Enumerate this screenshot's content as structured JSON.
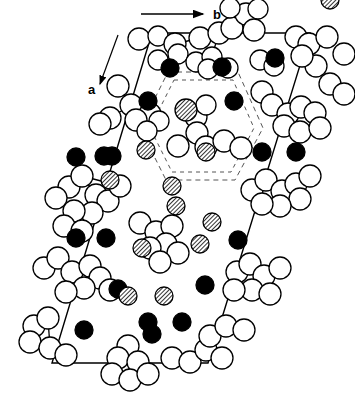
{
  "figure": {
    "kind": "crystal-structure-projection",
    "caption": "",
    "background_color": "#ffffff",
    "stroke_color": "#000000",
    "width": 355,
    "height": 397
  },
  "axes": {
    "b_axis": {
      "label": "b",
      "arrow_from": [
        141,
        14
      ],
      "arrow_to": [
        203,
        14
      ],
      "label_pos": [
        213,
        19
      ]
    },
    "a_axis": {
      "label": "a",
      "arrow_from": [
        118,
        35
      ],
      "arrow_to": [
        100,
        84
      ],
      "label_pos": [
        88,
        94
      ]
    }
  },
  "unit_cell": {
    "name": "unit-cell-parallelogram",
    "stroke": "#000000",
    "stroke_width": 1.4,
    "corners": [
      [
        152,
        33
      ],
      [
        310,
        33
      ],
      [
        208,
        363
      ],
      [
        52,
        363
      ]
    ]
  },
  "dashed_hexagons": [
    {
      "name": "outer-dashed-hexagon",
      "stroke": "#555555",
      "dash": "5,4",
      "points": [
        [
          168,
          72
        ],
        [
          238,
          72
        ],
        [
          263,
          128
        ],
        [
          235,
          180
        ],
        [
          166,
          180
        ],
        [
          140,
          128
        ]
      ]
    },
    {
      "name": "inner-dashed-hexagon",
      "stroke": "#555555",
      "dash": "4,4",
      "points": [
        [
          174,
          80
        ],
        [
          233,
          80
        ],
        [
          254,
          128
        ],
        [
          231,
          172
        ],
        [
          172,
          172
        ],
        [
          150,
          128
        ]
      ]
    }
  ],
  "atom_legend": [
    {
      "key": "open",
      "label": "open-circle-atom",
      "fill": "#ffffff",
      "stroke": "#000000"
    },
    {
      "key": "filled",
      "label": "filled-black-atom",
      "fill": "#000000",
      "stroke": "#000000"
    },
    {
      "key": "hatched",
      "label": "hatched-atom",
      "fill": "hatch-pattern",
      "stroke": "#000000"
    }
  ],
  "chart_data": {
    "type": "scatter",
    "title": "",
    "xlabel": "b",
    "ylabel": "a",
    "xlim": [
      0,
      355
    ],
    "ylim": [
      0,
      397
    ],
    "grid": false,
    "legend": [
      "open",
      "filled",
      "hatched"
    ],
    "series": [
      {
        "name": "open",
        "points": [
          [
            139,
            39,
            11
          ],
          [
            158,
            36,
            10
          ],
          [
            175,
            44,
            11
          ],
          [
            200,
            38,
            11
          ],
          [
            219,
            33,
            11
          ],
          [
            232,
            28,
            11
          ],
          [
            246,
            14,
            11
          ],
          [
            254,
            30,
            11
          ],
          [
            230,
            8,
            10
          ],
          [
            258,
            9,
            10
          ],
          [
            296,
            37,
            11
          ],
          [
            309,
            44,
            11
          ],
          [
            327,
            37,
            11
          ],
          [
            344,
            54,
            11
          ],
          [
            316,
            66,
            11
          ],
          [
            302,
            56,
            11
          ],
          [
            158,
            60,
            10
          ],
          [
            178,
            54,
            10
          ],
          [
            196,
            62,
            10
          ],
          [
            212,
            57,
            10
          ],
          [
            208,
            69,
            10
          ],
          [
            228,
            68,
            10
          ],
          [
            260,
            60,
            10
          ],
          [
            274,
            66,
            10
          ],
          [
            118,
            86,
            11
          ],
          [
            131,
            105,
            11
          ],
          [
            110,
            118,
            11
          ],
          [
            150,
            114,
            11
          ],
          [
            136,
            120,
            11
          ],
          [
            159,
            121,
            10
          ],
          [
            100,
            124,
            11
          ],
          [
            147,
            131,
            10
          ],
          [
            262,
            92,
            11
          ],
          [
            272,
            105,
            11
          ],
          [
            288,
            114,
            11
          ],
          [
            301,
            107,
            11
          ],
          [
            315,
            113,
            11
          ],
          [
            284,
            126,
            11
          ],
          [
            300,
            132,
            11
          ],
          [
            320,
            128,
            11
          ],
          [
            196,
            117,
            11
          ],
          [
            206,
            105,
            10
          ],
          [
            197,
            133,
            11
          ],
          [
            178,
            146,
            11
          ],
          [
            206,
            147,
            11
          ],
          [
            224,
            141,
            11
          ],
          [
            241,
            148,
            11
          ],
          [
            69,
            187,
            11
          ],
          [
            82,
            176,
            11
          ],
          [
            56,
            198,
            11
          ],
          [
            96,
            195,
            11
          ],
          [
            108,
            201,
            11
          ],
          [
            92,
            213,
            11
          ],
          [
            74,
            211,
            11
          ],
          [
            120,
            186,
            11
          ],
          [
            64,
            226,
            11
          ],
          [
            82,
            231,
            11
          ],
          [
            252,
            190,
            11
          ],
          [
            266,
            180,
            11
          ],
          [
            282,
            191,
            11
          ],
          [
            296,
            184,
            11
          ],
          [
            300,
            199,
            11
          ],
          [
            280,
            206,
            11
          ],
          [
            262,
            204,
            11
          ],
          [
            310,
            176,
            11
          ],
          [
            140,
            223,
            11
          ],
          [
            156,
            232,
            11
          ],
          [
            172,
            226,
            11
          ],
          [
            166,
            244,
            11
          ],
          [
            150,
            248,
            11
          ],
          [
            178,
            253,
            11
          ],
          [
            160,
            262,
            11
          ],
          [
            44,
            268,
            11
          ],
          [
            58,
            258,
            11
          ],
          [
            72,
            272,
            11
          ],
          [
            90,
            266,
            11
          ],
          [
            100,
            278,
            11
          ],
          [
            84,
            288,
            11
          ],
          [
            66,
            292,
            11
          ],
          [
            110,
            290,
            11
          ],
          [
            237,
            272,
            11
          ],
          [
            250,
            264,
            11
          ],
          [
            264,
            276,
            11
          ],
          [
            280,
            268,
            11
          ],
          [
            252,
            290,
            11
          ],
          [
            270,
            294,
            11
          ],
          [
            234,
            290,
            11
          ],
          [
            34,
            326,
            11
          ],
          [
            48,
            318,
            11
          ],
          [
            30,
            342,
            11
          ],
          [
            50,
            348,
            11
          ],
          [
            66,
            355,
            11
          ],
          [
            128,
            346,
            11
          ],
          [
            118,
            358,
            11
          ],
          [
            138,
            362,
            11
          ],
          [
            112,
            374,
            11
          ],
          [
            130,
            380,
            11
          ],
          [
            148,
            374,
            11
          ],
          [
            172,
            358,
            11
          ],
          [
            190,
            362,
            11
          ],
          [
            206,
            350,
            11
          ],
          [
            222,
            358,
            11
          ],
          [
            210,
            336,
            11
          ],
          [
            226,
            326,
            11
          ],
          [
            244,
            330,
            11
          ],
          [
            330,
            84,
            11
          ],
          [
            344,
            94,
            11
          ]
        ]
      },
      {
        "name": "filled",
        "points": [
          [
            170,
            68,
            9
          ],
          [
            222,
            67,
            9
          ],
          [
            275,
            58,
            9
          ],
          [
            148,
            101,
            9
          ],
          [
            234,
            101,
            9
          ],
          [
            262,
            152,
            9
          ],
          [
            112,
            156,
            9
          ],
          [
            104,
            156,
            9
          ],
          [
            76,
            238,
            9
          ],
          [
            106,
            238,
            9
          ],
          [
            238,
            240,
            9
          ],
          [
            118,
            289,
            9
          ],
          [
            205,
            285,
            9
          ],
          [
            84,
            330,
            9
          ],
          [
            148,
            322,
            9
          ],
          [
            182,
            322,
            9
          ],
          [
            152,
            334,
            9
          ],
          [
            296,
            152,
            9
          ],
          [
            76,
            157,
            9
          ]
        ]
      },
      {
        "name": "hatched",
        "points": [
          [
            186,
            110,
            11
          ],
          [
            146,
            150,
            9
          ],
          [
            206,
            152,
            9
          ],
          [
            176,
            206,
            9
          ],
          [
            172,
            186,
            9
          ],
          [
            212,
            222,
            9
          ],
          [
            142,
            248,
            9
          ],
          [
            200,
            244,
            9
          ],
          [
            128,
            296,
            9
          ],
          [
            164,
            296,
            9
          ],
          [
            330,
            0,
            9
          ],
          [
            110,
            180,
            9
          ]
        ]
      }
    ],
    "bonds": [
      [
        139,
        39,
        158,
        36
      ],
      [
        158,
        36,
        175,
        44
      ],
      [
        175,
        44,
        200,
        38
      ],
      [
        200,
        38,
        219,
        33
      ],
      [
        219,
        33,
        232,
        28
      ],
      [
        232,
        28,
        246,
        14
      ],
      [
        219,
        33,
        208,
        69
      ],
      [
        232,
        28,
        254,
        30
      ],
      [
        296,
        37,
        309,
        44
      ],
      [
        309,
        44,
        327,
        37
      ],
      [
        309,
        44,
        316,
        66
      ],
      [
        316,
        66,
        302,
        56
      ],
      [
        118,
        86,
        131,
        105
      ],
      [
        131,
        105,
        110,
        118
      ],
      [
        131,
        105,
        150,
        114
      ],
      [
        131,
        105,
        136,
        120
      ],
      [
        136,
        120,
        147,
        131
      ],
      [
        110,
        118,
        100,
        124
      ],
      [
        262,
        92,
        272,
        105
      ],
      [
        272,
        105,
        288,
        114
      ],
      [
        288,
        114,
        301,
        107
      ],
      [
        288,
        114,
        284,
        126
      ],
      [
        284,
        126,
        300,
        132
      ],
      [
        300,
        132,
        320,
        128
      ],
      [
        196,
        117,
        206,
        105
      ],
      [
        196,
        117,
        197,
        133
      ],
      [
        197,
        133,
        178,
        146
      ],
      [
        197,
        133,
        206,
        147
      ],
      [
        206,
        147,
        224,
        141
      ],
      [
        224,
        141,
        241,
        148
      ],
      [
        69,
        187,
        82,
        176
      ],
      [
        82,
        176,
        96,
        195
      ],
      [
        96,
        195,
        108,
        201
      ],
      [
        96,
        195,
        92,
        213
      ],
      [
        92,
        213,
        74,
        211
      ],
      [
        82,
        176,
        120,
        186
      ],
      [
        74,
        211,
        64,
        226
      ],
      [
        64,
        226,
        82,
        231
      ],
      [
        252,
        190,
        266,
        180
      ],
      [
        266,
        180,
        282,
        191
      ],
      [
        282,
        191,
        296,
        184
      ],
      [
        282,
        191,
        280,
        206
      ],
      [
        280,
        206,
        262,
        204
      ],
      [
        296,
        184,
        310,
        176
      ],
      [
        140,
        223,
        156,
        232
      ],
      [
        156,
        232,
        172,
        226
      ],
      [
        156,
        232,
        166,
        244
      ],
      [
        166,
        244,
        150,
        248
      ],
      [
        166,
        244,
        178,
        253
      ],
      [
        150,
        248,
        160,
        262
      ],
      [
        44,
        268,
        58,
        258
      ],
      [
        58,
        258,
        72,
        272
      ],
      [
        72,
        272,
        90,
        266
      ],
      [
        90,
        266,
        100,
        278
      ],
      [
        100,
        278,
        84,
        288
      ],
      [
        84,
        288,
        66,
        292
      ],
      [
        100,
        278,
        110,
        290
      ],
      [
        237,
        272,
        250,
        264
      ],
      [
        250,
        264,
        264,
        276
      ],
      [
        264,
        276,
        280,
        268
      ],
      [
        264,
        276,
        252,
        290
      ],
      [
        252,
        290,
        270,
        294
      ],
      [
        252,
        290,
        234,
        290
      ],
      [
        34,
        326,
        48,
        318
      ],
      [
        48,
        318,
        50,
        348
      ],
      [
        50,
        348,
        66,
        355
      ],
      [
        128,
        346,
        118,
        358
      ],
      [
        118,
        358,
        138,
        362
      ],
      [
        128,
        346,
        130,
        380
      ],
      [
        130,
        380,
        112,
        374
      ],
      [
        130,
        380,
        148,
        374
      ],
      [
        172,
        358,
        190,
        362
      ],
      [
        190,
        362,
        206,
        350
      ],
      [
        206,
        350,
        222,
        358
      ],
      [
        210,
        336,
        226,
        326
      ],
      [
        226,
        326,
        244,
        330
      ],
      [
        210,
        336,
        206,
        350
      ],
      [
        330,
        84,
        344,
        94
      ]
    ]
  }
}
